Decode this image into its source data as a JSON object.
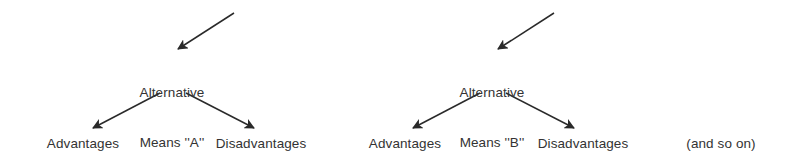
{
  "diagram": {
    "type": "tree-branching-alternatives",
    "background_color": "#ffffff",
    "ink_color": "#2a2a2a",
    "text_color": "#333333",
    "width": 790,
    "height": 165,
    "clusters": [
      {
        "id": "cluster-a",
        "node": {
          "line1": "Alternative",
          "line2": "Means ''A''",
          "center_x": 172,
          "top_y": 52
        },
        "leaves": [
          {
            "id": "advantages-a",
            "label": "Advantages",
            "center_x": 83,
            "top_y": 136
          },
          {
            "id": "disadvantages-a",
            "label": "Disadvantages",
            "center_x": 261,
            "top_y": 136
          }
        ]
      },
      {
        "id": "cluster-b",
        "node": {
          "line1": "Alternative",
          "line2": "Means ''B''",
          "center_x": 492,
          "top_y": 52
        },
        "leaves": [
          {
            "id": "advantages-b",
            "label": "Advantages",
            "center_x": 405,
            "top_y": 136
          },
          {
            "id": "disadvantages-b",
            "label": "Disadvantages",
            "center_x": 583,
            "top_y": 136
          }
        ]
      }
    ],
    "aside": {
      "label": "(and so on)",
      "center_x": 721,
      "top_y": 136
    },
    "arrows": [
      {
        "id": "incoming-a",
        "from_x": 234,
        "from_y": 13,
        "to_x": 178,
        "to_y": 49
      },
      {
        "id": "branch-a-left",
        "from_x": 160,
        "from_y": 93,
        "to_x": 93,
        "to_y": 128
      },
      {
        "id": "branch-a-right",
        "from_x": 186,
        "from_y": 93,
        "to_x": 254,
        "to_y": 128
      },
      {
        "id": "incoming-b",
        "from_x": 554,
        "from_y": 13,
        "to_x": 498,
        "to_y": 49
      },
      {
        "id": "branch-b-left",
        "from_x": 480,
        "from_y": 93,
        "to_x": 413,
        "to_y": 128
      },
      {
        "id": "branch-b-right",
        "from_x": 506,
        "from_y": 93,
        "to_x": 574,
        "to_y": 128
      }
    ]
  }
}
